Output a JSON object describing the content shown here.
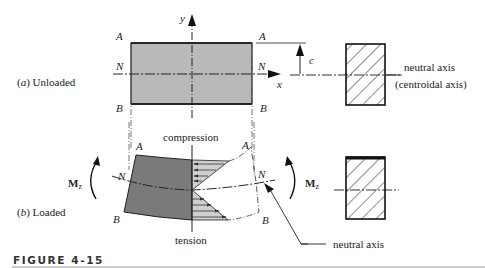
{
  "figure": {
    "caption": "FIGURE 4-15"
  },
  "panel_a": {
    "label_prefix": "(",
    "label_letter": "a",
    "label_suffix": ")  Unloaded",
    "point_A_left": "A",
    "point_N_left": "N",
    "point_B_left": "B",
    "point_A_right": "A",
    "point_N_right": "N",
    "point_B_right": "B",
    "y_axis": "y",
    "x_axis": "x",
    "dim_c": "c",
    "neutral_axis": "neutral axis",
    "centroidal_axis": "(centroidal axis)"
  },
  "panel_b": {
    "label_prefix": "(",
    "label_letter": "b",
    "label_suffix": ")  Loaded",
    "compression": "compression",
    "tension": "tension",
    "point_A_left": "A",
    "point_N_left": "N",
    "point_B_left": "B",
    "point_A_right": "A",
    "point_N_right": "N",
    "point_B_right": "B",
    "moment_left": "M",
    "moment_right": "M",
    "moment_sub": "z",
    "neutral_axis": "neutral axis"
  },
  "colors": {
    "beam_unloaded": "#b9b9b9",
    "beam_loaded": "#7a7a7a",
    "stress_fill": "#cfcfcf",
    "line": "#222222"
  }
}
